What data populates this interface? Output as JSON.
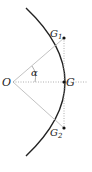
{
  "diagram": {
    "labels": {
      "origin": "O",
      "center": "G",
      "top_point": "G",
      "top_point_sub": "1",
      "bottom_point": "G",
      "bottom_point_sub": "2",
      "angle": "α"
    },
    "colors": {
      "arc": "#222222",
      "lines": "#aaaaaa",
      "points": "#111111"
    }
  }
}
